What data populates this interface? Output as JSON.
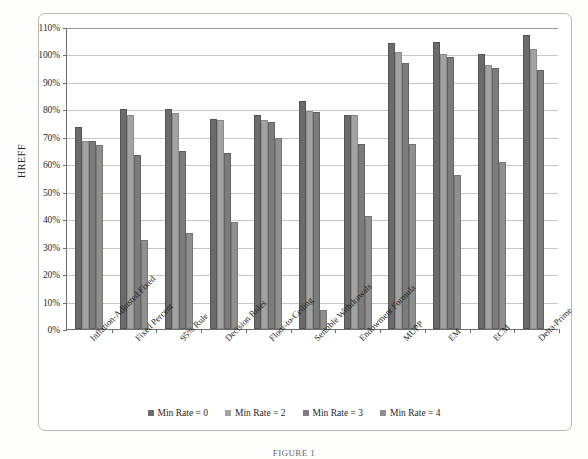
{
  "figure": {
    "caption": "FIGURE 1"
  },
  "chart_data": {
    "type": "bar",
    "title": "",
    "xlabel": "",
    "ylabel": "HREFF",
    "ylim": [
      0,
      110
    ],
    "ytick_step": 10,
    "ytick_labels": [
      "0%",
      "10%",
      "20%",
      "30%",
      "40%",
      "50%",
      "60%",
      "70%",
      "80%",
      "90%",
      "100%",
      "110%"
    ],
    "ytick_values": [
      0,
      10,
      20,
      30,
      40,
      50,
      60,
      70,
      80,
      90,
      100,
      110
    ],
    "grid": true,
    "legend_position": "bottom",
    "categories": [
      "Inflation-Adjusted Fixed",
      "Fixed Percent",
      "95% Rule",
      "Decision Rules",
      "Floor-to-Ceiling",
      "Sensible Withdrawals",
      "Endowment Formula",
      "MUPP",
      "EM",
      "ECM",
      "Delta-Prime"
    ],
    "series": [
      {
        "name": "Min Rate = 0",
        "color": "#6b6b6b",
        "values": [
          73.5,
          80.0,
          80.0,
          76.5,
          78.0,
          83.0,
          78.0,
          104.0,
          104.5,
          100.0,
          107.0
        ]
      },
      {
        "name": "Min Rate = 2",
        "color": "#a2a2a0",
        "values": [
          68.5,
          78.0,
          78.5,
          76.0,
          76.0,
          79.5,
          78.0,
          101.0,
          100.0,
          96.0,
          102.0
        ]
      },
      {
        "name": "Min Rate = 3",
        "color": "#7c7c7c",
        "values": [
          68.5,
          63.5,
          65.0,
          64.0,
          75.5,
          79.0,
          67.5,
          97.0,
          99.0,
          95.0,
          94.5
        ]
      },
      {
        "name": "Min Rate = 4",
        "color": "#8f8f8d",
        "values": [
          67.0,
          32.5,
          35.0,
          39.0,
          69.5,
          7.0,
          41.0,
          67.5,
          56.0,
          61.0,
          0.0
        ]
      }
    ]
  },
  "legend": {
    "items": [
      {
        "label": "Min Rate = 0"
      },
      {
        "label": "Min Rate = 2"
      },
      {
        "label": "Min Rate = 3"
      },
      {
        "label": "Min Rate = 4"
      }
    ]
  }
}
